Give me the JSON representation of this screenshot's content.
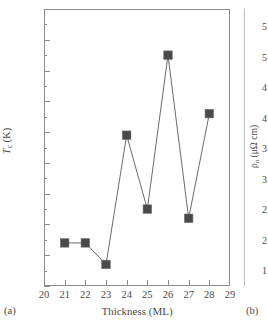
{
  "figure": {
    "panel_a_caption": "(a)",
    "panel_b_caption": "(b)"
  },
  "colors": {
    "marker": "#4a4a4a",
    "line": "#5a5a5a",
    "axis": "#8c8c8c",
    "text": "#4a4a4a",
    "background": "#ffffff"
  },
  "panel_a": {
    "ylabel_main": "T",
    "ylabel_sub": "c",
    "ylabel_unit": " (K)",
    "xlabel": "Thickness (ML)",
    "ytick_labels": [
      "6.5",
      "6.4",
      "6.3",
      "6.2",
      "6.1",
      "6.0",
      "5.9",
      "5.8",
      "5.7",
      "5.6"
    ],
    "xtick_labels": [
      "20",
      "21",
      "22",
      "23",
      "24",
      "25",
      "26",
      "27",
      "28",
      "29"
    ]
  },
  "panel_b": {
    "ylabel_main": "ρ",
    "ylabel_sub": "n",
    "ylabel_unit": " (μΩ cm)",
    "visible_tick_labels": [
      "5",
      "5",
      "4",
      "4",
      "3",
      "3",
      "2",
      "2",
      "1"
    ]
  },
  "chart_data": {
    "type": "line",
    "title": "",
    "subtitle": "",
    "xlabel": "Thickness (ML)",
    "ylabel": "T_c (K)",
    "xlim": [
      20,
      29
    ],
    "ylim": [
      5.6,
      6.5
    ],
    "xtick_step": 1,
    "ytick_step": 0.1,
    "y_minor_tick_step": 0.05,
    "grid": false,
    "legend": null,
    "marker_style": "filled-square",
    "x": [
      21,
      22,
      23,
      24,
      25,
      26,
      27,
      28
    ],
    "values": [
      5.74,
      5.74,
      5.67,
      6.09,
      5.85,
      6.35,
      5.82,
      6.16
    ],
    "series": [
      {
        "name": "T_c vs thickness",
        "x": [
          21,
          22,
          23,
          24,
          25,
          26,
          27,
          28
        ],
        "values": [
          5.74,
          5.74,
          5.67,
          6.09,
          5.85,
          6.35,
          5.82,
          6.16
        ]
      }
    ],
    "annotations": []
  }
}
